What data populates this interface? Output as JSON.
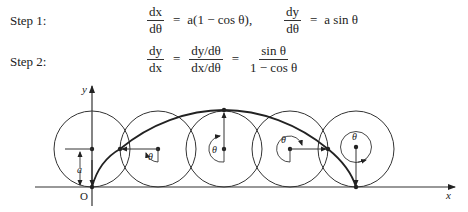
{
  "steps": [
    {
      "label": "Step 1:",
      "eq1": {
        "num": "dx",
        "den": "dθ",
        "eq": "=",
        "rhs": "a(1 − cos θ),"
      },
      "eq2": {
        "num": "dy",
        "den": "dθ",
        "eq": "=",
        "rhs": "a sin θ"
      }
    },
    {
      "label": "Step 2:",
      "lhs": {
        "num": "dy",
        "den": "dx"
      },
      "eq": "=",
      "mid": {
        "num": "dy/dθ",
        "den": "dx/dθ"
      },
      "eq2": "=",
      "rhs": {
        "num": "sin θ",
        "den": "1 − cos θ"
      }
    }
  ],
  "figure": {
    "axis_x_label": "x",
    "axis_y_label": "y",
    "origin_label": "O",
    "radius_label": "a",
    "angle_label": "θ",
    "circle_count": 5,
    "curve": "cycloid"
  }
}
